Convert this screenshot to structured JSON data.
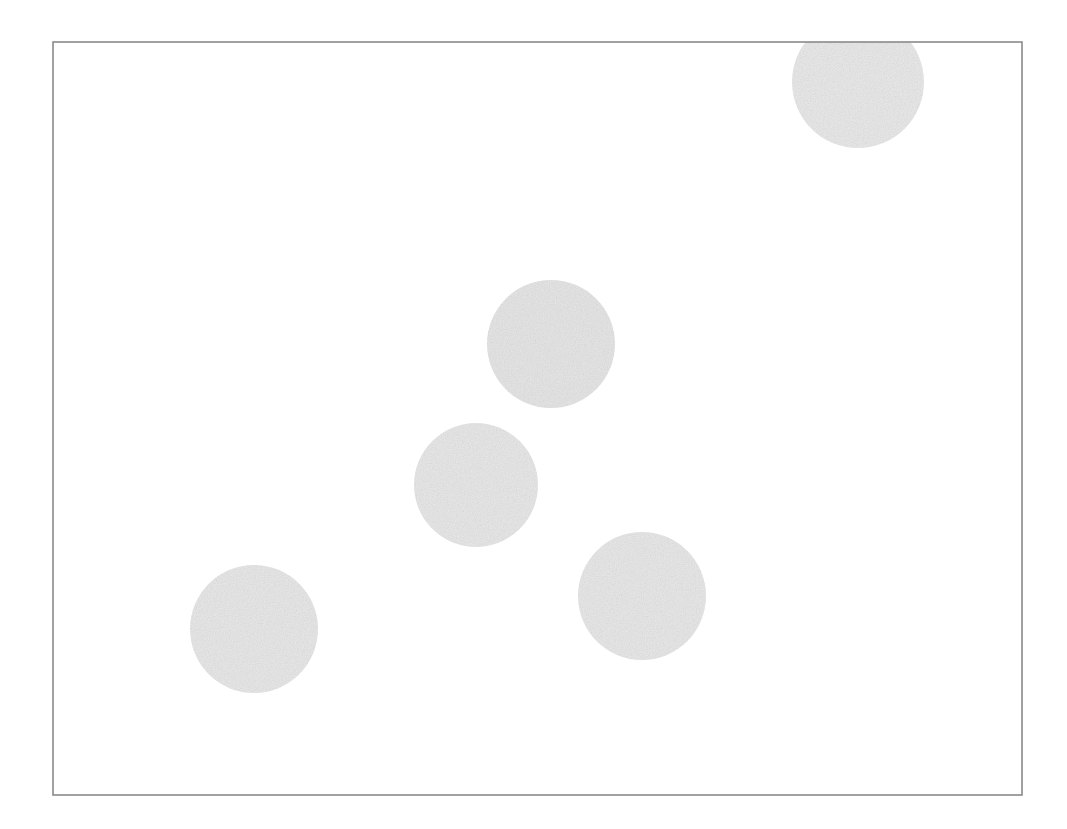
{
  "document": {
    "title": "Circle scatter figure",
    "background_color": "#ffffff",
    "width": 1067,
    "height": 829
  },
  "frame": {
    "name": "plot-border-rectangle",
    "x": 53,
    "y": 42,
    "width": 969,
    "height": 753,
    "stroke_color": "#8a8a8a",
    "stroke_width": 1.6,
    "fill_color": "#ffffff"
  },
  "chart_data": {
    "type": "scatter",
    "title": "",
    "subtitle": "",
    "xlabel": "",
    "ylabel": "",
    "grid": false,
    "legend": null,
    "axis_ticks": [],
    "tick_labels": [],
    "annotations": [],
    "marker_shape": "circle",
    "marker_fill_color": "#e8e8e8",
    "marker_edge_color": "none",
    "marker_texture": "speckled-noise",
    "xlim": [
      53,
      1022
    ],
    "ylim": [
      42,
      795
    ],
    "points": [
      {
        "id": "circle-1",
        "label": "top-right",
        "cx": 858,
        "cy": 82,
        "r": 66,
        "clipped_by_frame": true,
        "fill": "#e9e9e9"
      },
      {
        "id": "circle-2",
        "label": "upper-middle",
        "cx": 551,
        "cy": 344,
        "r": 64,
        "clipped_by_frame": false,
        "fill": "#e6e6e6"
      },
      {
        "id": "circle-3",
        "label": "center",
        "cx": 476,
        "cy": 485,
        "r": 62,
        "clipped_by_frame": false,
        "fill": "#e8e8e8"
      },
      {
        "id": "circle-4",
        "label": "lower-right",
        "cx": 642,
        "cy": 596,
        "r": 64,
        "clipped_by_frame": false,
        "fill": "#e8e8e8"
      },
      {
        "id": "circle-5",
        "label": "lower-left",
        "cx": 254,
        "cy": 629,
        "r": 64,
        "clipped_by_frame": false,
        "fill": "#e8e8e8"
      }
    ]
  }
}
